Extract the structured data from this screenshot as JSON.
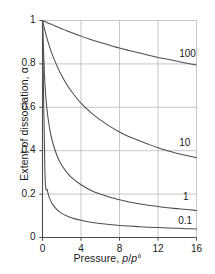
{
  "chart_data": {
    "type": "line",
    "title": "",
    "xlabel": "Pressure, p/p°",
    "ylabel": "Extent of dissociation, α",
    "xlim": [
      0,
      16
    ],
    "ylim": [
      0,
      1
    ],
    "xticks": [
      "0",
      "4",
      "8",
      "12",
      "16"
    ],
    "xtick_values": [
      0,
      4,
      8,
      12,
      16
    ],
    "yticks": [
      "0",
      "0.2",
      "0.4",
      "0.6",
      "0.8",
      "1"
    ],
    "ytick_values": [
      0,
      0.2,
      0.4,
      0.6,
      0.8,
      1
    ],
    "grid": true,
    "grid_color": "#b9b9b9",
    "axis_color": "#4d4d4d",
    "curve_color": "#4d4d4d",
    "legend_position": "inline-right-of-curve",
    "x": [
      0,
      0.25,
      0.5,
      0.75,
      1,
      1.5,
      2,
      2.5,
      3,
      4,
      5,
      6,
      7,
      8,
      9,
      10,
      11,
      12,
      13,
      14,
      15,
      16
    ],
    "series": [
      {
        "name": "100",
        "label": "100",
        "label_x": 14.2,
        "label_y": 0.845,
        "values": [
          1,
          0.995,
          0.99,
          0.985,
          0.981,
          0.971,
          0.962,
          0.953,
          0.945,
          0.928,
          0.913,
          0.899,
          0.886,
          0.873,
          0.862,
          0.851,
          0.84,
          0.83,
          0.821,
          0.812,
          0.803,
          0.795
        ]
      },
      {
        "name": "10",
        "label": "10",
        "label_x": 14.2,
        "label_y": 0.432,
        "values": [
          1,
          0.953,
          0.913,
          0.877,
          0.845,
          0.791,
          0.745,
          0.707,
          0.674,
          0.619,
          0.577,
          0.542,
          0.512,
          0.486,
          0.464,
          0.447,
          0.43,
          0.414,
          0.4,
          0.387,
          0.378,
          0.368
        ]
      },
      {
        "name": "1",
        "label": "1",
        "label_x": 14.6,
        "label_y": 0.185,
        "values": [
          1,
          0.707,
          0.577,
          0.5,
          0.447,
          0.378,
          0.333,
          0.302,
          0.277,
          0.243,
          0.218,
          0.2,
          0.185,
          0.174,
          0.164,
          0.156,
          0.149,
          0.143,
          0.137,
          0.133,
          0.129,
          0.124
        ]
      },
      {
        "name": "0.1",
        "label": "0.1",
        "label_x": 14.1,
        "label_y": 0.073,
        "values": [
          1,
          0.302,
          0.218,
          0.179,
          0.156,
          0.128,
          0.111,
          0.1,
          0.091,
          0.079,
          0.0705,
          0.0645,
          0.0597,
          0.0557,
          0.0526,
          0.0499,
          0.0476,
          0.0456,
          0.0438,
          0.0422,
          0.0408,
          0.0395
        ]
      }
    ]
  }
}
